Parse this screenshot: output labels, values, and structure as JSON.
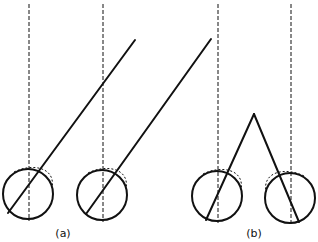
{
  "diagram": {
    "type": "eye-vergence-schematic",
    "colors": {
      "stroke": "#111111",
      "background": "#ffffff"
    },
    "panels": [
      {
        "label": "(a)",
        "label_pos": [
          63,
          228
        ],
        "description": "Parallel lines of sight - both eyes look along parallel oblique lines",
        "eyes": [
          {
            "cx": 28,
            "cy": 194,
            "r": 25,
            "axis_x": 29,
            "sight": [
              [
                8,
                213
              ],
              [
                135,
                40
              ]
            ]
          },
          {
            "cx": 102,
            "cy": 195,
            "r": 25,
            "axis_x": 103,
            "sight": [
              [
                86,
                214
              ],
              [
                211,
                39
              ]
            ]
          }
        ]
      },
      {
        "label": "(b)",
        "label_pos": [
          254,
          228
        ],
        "description": "Converging lines of sight meeting at a near point",
        "eyes": [
          {
            "cx": 217,
            "cy": 196,
            "r": 25,
            "axis_x": 218,
            "sight": [
              [
                206,
                220
              ],
              [
                254,
                114
              ]
            ]
          },
          {
            "cx": 290,
            "cy": 198,
            "r": 25,
            "axis_x": 291,
            "sight": [
              [
                299,
                222
              ],
              [
                254,
                114
              ]
            ]
          }
        ]
      }
    ]
  }
}
